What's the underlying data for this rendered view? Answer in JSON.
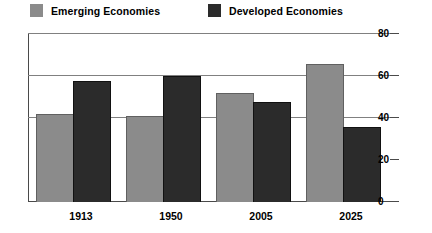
{
  "legend": {
    "position": "top",
    "entries": [
      {
        "label": "Emerging Economies",
        "color": "#8b8b8b",
        "icon": "square-swatch-icon"
      },
      {
        "label": "Developed Economies",
        "color": "#2b2b2b",
        "icon": "square-swatch-icon"
      }
    ]
  },
  "axis": {
    "y_ticks": [
      "0",
      "20",
      "40",
      "60",
      "80"
    ],
    "x_labels": [
      "1913",
      "1950",
      "2005",
      "2025"
    ]
  },
  "chart_data": {
    "type": "bar",
    "title": "",
    "subtitle": "",
    "xlabel": "",
    "ylabel": "",
    "categories": [
      "1913",
      "1950",
      "2005",
      "2025"
    ],
    "series": [
      {
        "name": "Emerging Economies",
        "color": "#8b8b8b",
        "values": [
          41,
          40,
          51,
          65
        ]
      },
      {
        "name": "Developed Economies",
        "color": "#2b2b2b",
        "values": [
          57,
          59,
          47,
          35
        ]
      }
    ],
    "ylim": [
      0,
      80
    ],
    "yticks": [
      0,
      20,
      40,
      60,
      80
    ],
    "grid": true,
    "gridlines_drawn": [
      40,
      60,
      80
    ],
    "legend_position": "top",
    "annotations": []
  }
}
